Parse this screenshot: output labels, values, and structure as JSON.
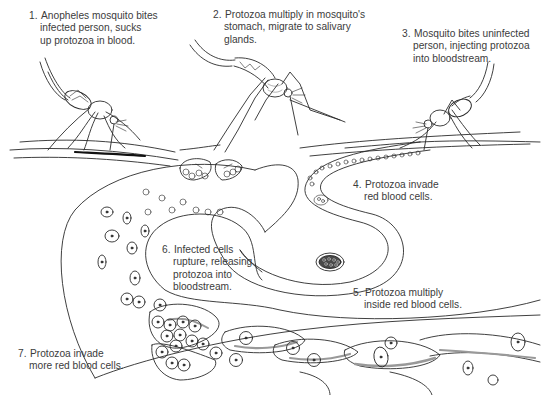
{
  "diagram": {
    "steps": [
      {
        "number": "1.",
        "lines": [
          "Anopheles mosquito bites",
          "infected person, sucks",
          "up protozoa in blood."
        ]
      },
      {
        "number": "2.",
        "lines": [
          "Protozoa multiply in mosquito's",
          "stomach, migrate to salivary",
          "glands."
        ]
      },
      {
        "number": "3.",
        "lines": [
          "Mosquito bites uninfected",
          "person, injecting protozoa",
          "into bloodstream."
        ]
      },
      {
        "number": "4.",
        "lines": [
          "Protozoa invade",
          "red blood cells."
        ]
      },
      {
        "number": "5.",
        "lines": [
          "Protozoa multiply",
          "inside red blood cells."
        ]
      },
      {
        "number": "6.",
        "lines": [
          "Infected cells",
          "rupture, releasing",
          "protozoa into",
          "bloodstream."
        ]
      },
      {
        "number": "7.",
        "lines": [
          "Protozoa invade",
          "more red blood cells."
        ]
      }
    ],
    "illustrations": [
      "mosquito-1-feeding",
      "mosquito-2-infected",
      "mosquito-3-biting",
      "blood-vessel-path",
      "red-blood-cells"
    ],
    "colors": {
      "line": "#2a2a2a",
      "text": "#3c3c3c",
      "shade": "#9a9a9a",
      "background": "#ffffff"
    }
  }
}
